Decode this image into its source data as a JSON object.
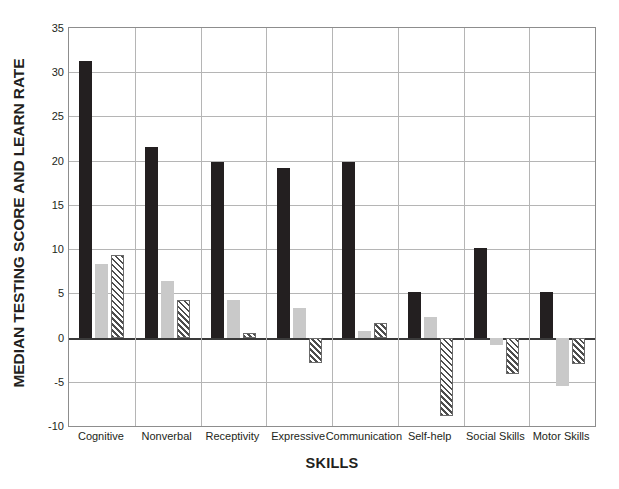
{
  "chart_data": {
    "type": "bar",
    "title": "",
    "xlabel": "SKILLS",
    "ylabel": "MEDIAN TESTING SCORE AND LEARN RATE",
    "categories": [
      "Cognitive",
      "Nonverbal",
      "Receptivity",
      "Expressive",
      "Communication",
      "Self-help",
      "Social Skills",
      "Motor Skills"
    ],
    "series": [
      {
        "name": "series-1-black",
        "color": "#231f20",
        "fill": "solid",
        "values": [
          31.3,
          21.5,
          19.9,
          19.2,
          19.9,
          5.1,
          10.1,
          5.2
        ]
      },
      {
        "name": "series-2-gray",
        "color": "#c9c9c9",
        "fill": "solid",
        "values": [
          8.3,
          6.4,
          4.3,
          3.3,
          0.7,
          2.3,
          -0.8,
          -5.5
        ]
      },
      {
        "name": "series-3-hatched",
        "color": "#4d4d4d",
        "fill": "diagonal-hatch",
        "values": [
          9.3,
          4.2,
          0.5,
          -2.9,
          1.7,
          -8.9,
          -4.1,
          -3.0
        ]
      }
    ],
    "ylim": [
      -10,
      35
    ],
    "yticks": [
      35,
      30,
      25,
      20,
      15,
      10,
      5,
      0,
      -5,
      -10
    ],
    "ytick_labels": [
      "35",
      "30",
      "25",
      "20",
      "15",
      "10",
      "5",
      "0",
      "-5",
      "-10"
    ],
    "grid": "horizontal-and-vertical-category-separators",
    "legend": "none",
    "zero_line": 0
  }
}
